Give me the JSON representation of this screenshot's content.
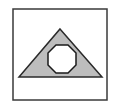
{
  "figure": {
    "frame": {
      "x": 13,
      "y": 9,
      "width": 94,
      "height": 91,
      "stroke": "#3a3a3a"
    },
    "triangle": {
      "points": "60,29 102,77 19,77",
      "fill": "#bdbdbd",
      "stroke": "#2a2a2a"
    },
    "octagon": {
      "points": "56,45 68,45 76,53 76,65 68,73 56,73 48,65 48,53",
      "fill": "#ffffff",
      "stroke": "#1a1a1a"
    }
  },
  "colors": {
    "background": "#ffffff",
    "shape_fill": "#bdbdbd",
    "outline": "#2a2a2a"
  }
}
